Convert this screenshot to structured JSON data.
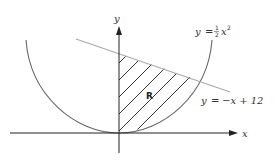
{
  "diagram": {
    "title": "",
    "axes": {
      "x_label": "x",
      "y_label": "y",
      "origin_px": [
        119,
        133
      ],
      "scale_px_per_unit": {
        "x": 20.25,
        "y": 6.6
      }
    },
    "curves": [
      {
        "id": "parabola",
        "label_lhs": "y",
        "label_eq": "=",
        "label_frac_num": "1",
        "label_frac_den": "2",
        "label_var": "x",
        "label_exp": "2",
        "label_full": "y = ½x²",
        "color": "#666666"
      },
      {
        "id": "line",
        "label_full": "y = −x + 12",
        "label_lhs": "y",
        "label_eq": "=",
        "label_rhs": "−x + 12",
        "color": "#aaaaaa",
        "slope": -1,
        "intercept": 12
      }
    ],
    "region": {
      "label": "R",
      "description": "Region bounded by the y-axis, y = ½x², and y = −x + 12 (shaded with diagonal hatching)",
      "hatch_color": "#333333"
    },
    "intersection": {
      "x": 4,
      "y": 8
    }
  },
  "colors": {
    "axis": "#222222",
    "parabola": "#666666",
    "line": "#aaaaaa",
    "hatch": "#333333",
    "text": "#333333"
  }
}
